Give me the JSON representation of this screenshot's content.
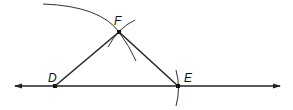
{
  "diagram": {
    "type": "geometric-construction",
    "line_color": "#222222",
    "points": {
      "D": {
        "label": "D",
        "x": 55,
        "y": 86
      },
      "E": {
        "label": "E",
        "x": 178,
        "y": 86
      },
      "F": {
        "label": "F",
        "x": 119,
        "y": 32
      }
    },
    "segments": [
      "DF",
      "FE"
    ],
    "line": {
      "through": [
        "D",
        "E"
      ],
      "arrows": "both"
    },
    "arcs": [
      {
        "name": "large-arc-centered-D",
        "through": "F"
      },
      {
        "name": "small-arc-at-F"
      },
      {
        "name": "arc-at-E"
      }
    ]
  }
}
